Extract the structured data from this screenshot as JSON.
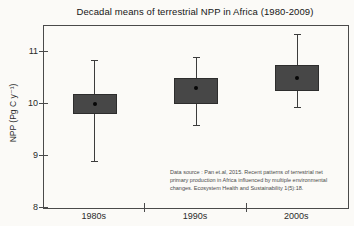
{
  "chart_data": {
    "type": "boxplot",
    "title": "Decadal means of terrestrial NPP in Africa (1980-2009)",
    "ylabel": "NPP (Pg C y⁻¹)",
    "xlabel": "",
    "categories": [
      "1980s",
      "1990s",
      "2000s"
    ],
    "series": [
      {
        "category": "1980s",
        "mean": 10.0,
        "box_low": 9.8,
        "box_high": 10.2,
        "whisker_low": 8.9,
        "whisker_high": 10.85
      },
      {
        "category": "1990s",
        "mean": 10.3,
        "box_low": 10.0,
        "box_high": 10.5,
        "whisker_low": 9.6,
        "whisker_high": 10.9
      },
      {
        "category": "2000s",
        "mean": 10.5,
        "box_low": 10.25,
        "box_high": 10.75,
        "whisker_low": 9.95,
        "whisker_high": 11.35
      }
    ],
    "ylim": [
      8,
      11.5
    ],
    "y_ticks": [
      8,
      9,
      10,
      11
    ],
    "grid": false,
    "legend": "none",
    "annotation": "Data source : Pan et.al,  2015. Recent patterns of terrestrial net primary production in Africa influenced by multiple environmental changes. Ecosystem Health and Sustainability 1(5):18.",
    "colors": {
      "box_fill": "#474747",
      "line": "#3c3c3c",
      "mean_dot": "#070707",
      "background": "#fbfaf7"
    }
  }
}
